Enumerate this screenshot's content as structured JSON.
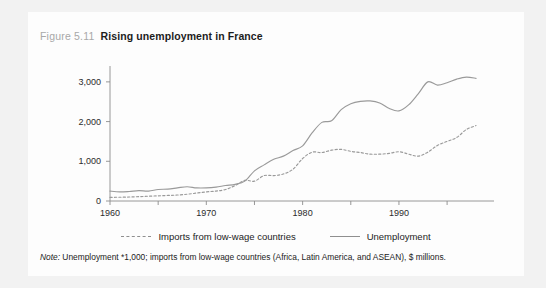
{
  "figure": {
    "number": "Figure 5.11",
    "title": "Rising unemployment in France",
    "note_label": "Note:",
    "note_text": "Unemployment *1,000; imports from low-wage countries (Africa, Latin America, and ASEAN), $ millions."
  },
  "colors": {
    "page_background": "#f2f2f2",
    "panel_background": "#fdfdfd",
    "line": "#9a9a9a",
    "axis": "#8c8c8c",
    "title_text": "#1c1c1c",
    "figure_number_text": "#a8a8a8"
  },
  "legend": {
    "position": "bottom-center",
    "items": [
      {
        "label": "Imports from low-wage countries",
        "style": "dashed"
      },
      {
        "label": "Unemployment",
        "style": "solid"
      }
    ]
  },
  "chart_data": {
    "type": "line",
    "title": "Rising unemployment in France",
    "xlabel": "",
    "ylabel": "",
    "xlim": [
      1960,
      1998
    ],
    "ylim": [
      0,
      3400
    ],
    "grid": false,
    "x_ticks": [
      1960,
      1970,
      1980,
      1990
    ],
    "x_minor_ticks": [
      1965,
      1975,
      1985,
      1995
    ],
    "y_ticks": [
      0,
      1000,
      2000,
      3000
    ],
    "y_tick_labels": [
      "0",
      "1,000",
      "2,000",
      "3,000"
    ],
    "x": [
      1960,
      1961,
      1962,
      1963,
      1964,
      1965,
      1966,
      1967,
      1968,
      1969,
      1970,
      1971,
      1972,
      1973,
      1974,
      1975,
      1976,
      1977,
      1978,
      1979,
      1980,
      1981,
      1982,
      1983,
      1984,
      1985,
      1986,
      1987,
      1988,
      1989,
      1990,
      1991,
      1992,
      1993,
      1994,
      1995,
      1996,
      1997,
      1998
    ],
    "series": [
      {
        "name": "Unemployment",
        "style": "solid",
        "units": "thousands",
        "values": [
          250,
          230,
          240,
          260,
          250,
          290,
          300,
          330,
          360,
          330,
          330,
          350,
          390,
          420,
          500,
          760,
          910,
          1050,
          1130,
          1270,
          1390,
          1720,
          1980,
          2020,
          2300,
          2450,
          2510,
          2520,
          2470,
          2330,
          2270,
          2420,
          2700,
          3000,
          2920,
          2980,
          3070,
          3120,
          3090
        ]
      },
      {
        "name": "Imports from low-wage countries",
        "style": "dashed",
        "units": "$ millions",
        "values": [
          90,
          95,
          100,
          110,
          120,
          130,
          140,
          150,
          170,
          200,
          230,
          250,
          290,
          390,
          520,
          500,
          640,
          640,
          680,
          800,
          1070,
          1230,
          1220,
          1280,
          1300,
          1250,
          1220,
          1180,
          1180,
          1200,
          1240,
          1180,
          1130,
          1230,
          1400,
          1500,
          1600,
          1800,
          1900
        ]
      }
    ]
  }
}
